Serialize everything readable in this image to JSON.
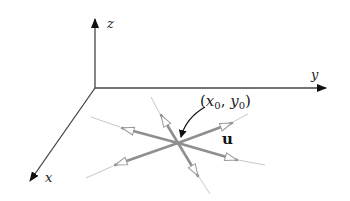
{
  "diagram": {
    "type": "directional-derivative-3d-axes",
    "axes": {
      "z": {
        "label": "z"
      },
      "y": {
        "label": "y"
      },
      "x": {
        "label": "x"
      }
    },
    "point_label": {
      "prefix": "(",
      "x": "x",
      "x_sub": "0",
      "sep": ", ",
      "y": "y",
      "y_sub": "0",
      "suffix": ")"
    },
    "vector_label": "u",
    "colors": {
      "axis": "#333333",
      "arrow": "#8c8c8c",
      "extension": "#c4c4c4",
      "pointer": "#111111"
    },
    "direction_count": 6
  }
}
